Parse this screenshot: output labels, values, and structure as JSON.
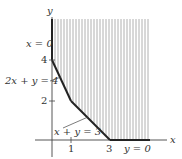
{
  "diagram": {
    "type": "feasible-region",
    "colors": {
      "axis": "#444444",
      "boundary": "#222222",
      "hatch": "#9a9a9a",
      "text": "#333333"
    },
    "axes": {
      "x_label": "x",
      "y_label": "y",
      "x_ticks": [
        "1",
        "3"
      ],
      "y_ticks": [
        "4",
        "2"
      ]
    },
    "constraints": [
      {
        "label": "x = 0"
      },
      {
        "label": "2x + y = 4"
      },
      {
        "label": "x + y = 3"
      },
      {
        "label": "y = 0"
      }
    ],
    "vertices": [
      [
        0,
        4
      ],
      [
        1,
        2
      ],
      [
        3,
        0
      ]
    ],
    "region": "shaded (vertical hatching) unbounded region above/right of boundary"
  }
}
